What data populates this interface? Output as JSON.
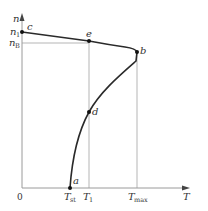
{
  "diagram": {
    "type": "speed-torque characteristic",
    "axes": {
      "x_label": "T",
      "y_label": "n",
      "origin_label": "0",
      "x_ticks": [
        {
          "main": "T",
          "sub": "st"
        },
        {
          "main": "T",
          "sub": "1"
        },
        {
          "main": "T",
          "sub": "max"
        }
      ],
      "y_ticks": [
        {
          "main": "n",
          "sub": "1"
        },
        {
          "main": "n",
          "sub": "B"
        }
      ]
    },
    "points": {
      "a": "a",
      "b": "b",
      "c": "c",
      "d": "d",
      "e": "e"
    },
    "colors": {
      "curve": "#2a2a2a",
      "guide": "#b5b5b5",
      "axis": "#9a9a9a"
    }
  }
}
